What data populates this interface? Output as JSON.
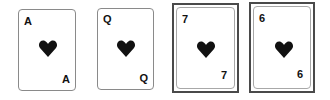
{
  "cards": [
    {
      "rank": "A",
      "suit": "heart",
      "highlighted": false
    },
    {
      "rank": "Q",
      "suit": "heart",
      "highlighted": false
    },
    {
      "rank": "7",
      "suit": "heart",
      "highlighted": true
    },
    {
      "rank": "6",
      "suit": "heart",
      "highlighted": true
    }
  ],
  "colors": {
    "suit": "#111111",
    "frame": "#4a4a4a",
    "card_border": "#8a8a8a"
  }
}
